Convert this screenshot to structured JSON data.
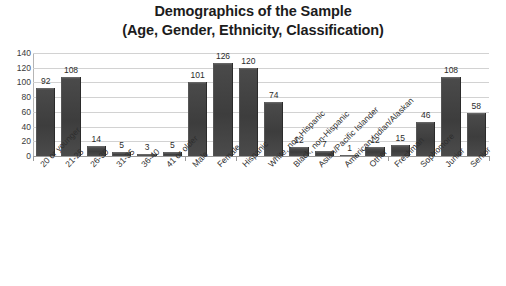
{
  "chart_data": {
    "type": "bar",
    "title": "Demographics of the Sample (Age, Gender, Ethnicity, Classification)",
    "title_line1": "Demographics of the Sample",
    "title_line2": "(Age, Gender, Ethnicity, Classification)",
    "xlabel": "",
    "ylabel": "",
    "ylim": [
      0,
      140
    ],
    "ytick_step": 20,
    "yticks": [
      "140",
      "120",
      "100",
      "80",
      "60",
      "40",
      "20",
      "0"
    ],
    "grid": true,
    "legend": "none",
    "bar_color": "#414141",
    "data_labels": true,
    "categories": [
      "20 or younger",
      "21-25",
      "26-30",
      "31-35",
      "36-40",
      "41 or older",
      "Male",
      "Female",
      "Hispanic",
      "White, non-Hispanic",
      "Black, non-Hispanic",
      "Asian/Pacific Islander",
      "American Indian/Alaskan",
      "Other",
      "Freshman",
      "Sophomore",
      "Junior",
      "Senior"
    ],
    "values": [
      92,
      108,
      14,
      5,
      3,
      5,
      101,
      126,
      120,
      74,
      12,
      7,
      1,
      12,
      15,
      46,
      108,
      58
    ],
    "groups": [
      {
        "name": "Age",
        "categories": [
          "20 or younger",
          "21-25",
          "26-30",
          "31-35",
          "36-40",
          "41 or older"
        ]
      },
      {
        "name": "Gender",
        "categories": [
          "Male",
          "Female"
        ]
      },
      {
        "name": "Ethnicity",
        "categories": [
          "Hispanic",
          "White, non-Hispanic",
          "Black, non-Hispanic",
          "Asian/Pacific Islander",
          "American Indian/Alaskan",
          "Other"
        ]
      },
      {
        "name": "Classification",
        "categories": [
          "Freshman",
          "Sophomore",
          "Junior",
          "Senior"
        ]
      }
    ]
  }
}
